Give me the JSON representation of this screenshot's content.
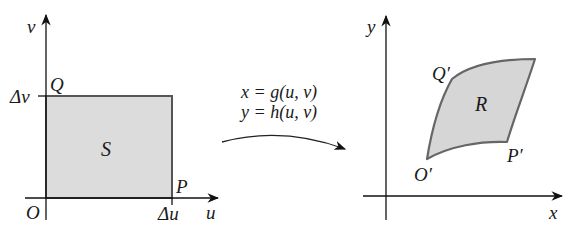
{
  "diagram": {
    "type": "change-of-variables-transformation",
    "left_panel": {
      "axes": {
        "horizontal_label": "u",
        "vertical_label": "v",
        "origin_label": "O"
      },
      "ticks": {
        "u_tick": "Δu",
        "v_tick": "Δv"
      },
      "region_label": "S",
      "corner_labels": {
        "P": "P",
        "Q": "Q"
      },
      "colors": {
        "fill": "#dcdcdc",
        "border": "#555555"
      }
    },
    "transformation": {
      "line1": "x = g(u, v)",
      "line2": "y = h(u, v)"
    },
    "right_panel": {
      "axes": {
        "horizontal_label": "x",
        "vertical_label": "y"
      },
      "region_label": "R",
      "corner_labels": {
        "O_prime": "O′",
        "P_prime": "P′",
        "Q_prime": "Q′"
      },
      "colors": {
        "fill": "#d6d6d6",
        "border": "#666666"
      }
    }
  }
}
